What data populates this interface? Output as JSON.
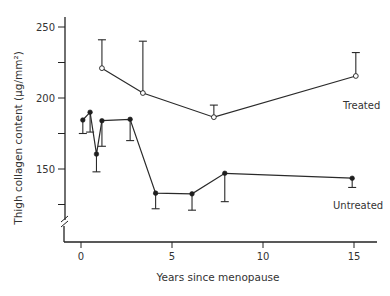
{
  "chart_data": {
    "type": "line",
    "title": "",
    "xlabel": "Years since menopause",
    "ylabel": "Thigh collagen content (µg/mm²)",
    "xlim": [
      -0.5,
      16.5
    ],
    "ylim": [
      110,
      260
    ],
    "y_axis_break": true,
    "grid": false,
    "x_ticks": [
      0,
      5,
      10,
      15
    ],
    "x_tick_labels": [
      "0",
      "5",
      "10",
      "15"
    ],
    "y_ticks": [
      250,
      200,
      150
    ],
    "y_tick_labels": [
      "250",
      "200",
      "150"
    ],
    "y_minor_ticks": [
      225,
      175,
      125
    ],
    "legend": "inline labels at right",
    "series": [
      {
        "name": "Treated",
        "marker": "open-circle",
        "error_bar_direction": "upper",
        "x": [
          1.15,
          3.4,
          7.3,
          15.1
        ],
        "values": [
          221,
          203.5,
          186.5,
          215.5
        ],
        "error_ends": [
          241,
          240,
          195,
          232
        ]
      },
      {
        "name": "Untreated",
        "marker": "filled-circle",
        "error_bar_direction": "lower",
        "x": [
          0.1,
          0.5,
          0.85,
          1.15,
          2.7,
          4.1,
          6.1,
          7.9,
          14.9
        ],
        "values": [
          184.5,
          190,
          160.5,
          184,
          185,
          133,
          132.5,
          147,
          143.5
        ],
        "error_ends": [
          175,
          176,
          148,
          166,
          170,
          122,
          121,
          127,
          137
        ]
      }
    ]
  },
  "labels": {
    "treated": "Treated",
    "untreated": "Untreated",
    "x_axis_title": "Years since menopause",
    "y_axis_title": "Thigh collagen content (µg/mm²)"
  }
}
